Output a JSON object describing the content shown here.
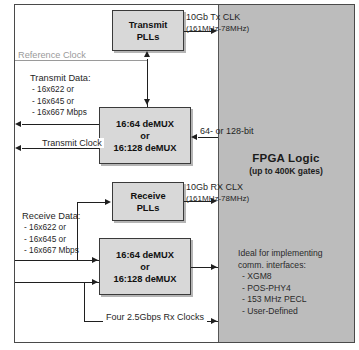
{
  "diagram": {
    "frame_border_color": "#4a4a4a",
    "fpga_fill_color": "#bcbcbc",
    "box_fill_color": "#d8d8d8",
    "line_color": "#1f1f1f",
    "reference_clock_color": "#9a9a9a"
  },
  "blocks": {
    "transmit_pll": {
      "line1": "Transmit",
      "line2": "PLLs"
    },
    "receive_pll": {
      "line1": "Receive",
      "line2": "PLLs"
    },
    "transmit_demux": {
      "line1": "16:64 deMUX",
      "line2": "or",
      "line3": "16:128 deMUX"
    },
    "receive_demux": {
      "line1": "16:64 deMUX",
      "line2": "or",
      "line3": "16:128 deMUX"
    },
    "fpga": {
      "title": "FPGA Logic",
      "subtitle": "(up to 400K gates)",
      "list_heading_line1": "Ideal for implementing",
      "list_heading_line2": "comm. interfaces:",
      "interfaces": [
        "- XGM8",
        "- POS-PHY4",
        "- 153 MHz PECL",
        "- User-Defined"
      ]
    }
  },
  "labels": {
    "reference_clock": "Reference Clock",
    "transmit_data": {
      "heading": "Transmit Data:",
      "items": [
        "- 16x622 or",
        "- 16x645 or",
        "- 16x667 Mbps"
      ]
    },
    "receive_data": {
      "heading": "Receive Data:",
      "items": [
        "- 16x622 or",
        "- 16x645 or",
        "- 16x667 Mbps"
      ]
    },
    "transmit_clock": "Transmit Clock",
    "tx_clk": "10Gb Tx CLK",
    "tx_clk_range": "(161MHz-78MHz)",
    "rx_clk": "10Gb RX CLX",
    "rx_clk_range": "(161MHz-78MHz)",
    "bus_width": "64- or 128-bit",
    "rx_clocks": "Four 2.5Gbps Rx Clocks"
  }
}
